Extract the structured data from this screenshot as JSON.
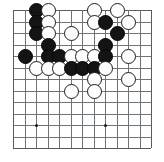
{
  "figure": {
    "name": "go-board-position",
    "board": {
      "columns": 13,
      "rows": 13,
      "origin_x": 13,
      "origin_y": 10,
      "spacing": 11.5,
      "line_color": "#6f7376",
      "edge_color": "#585c5f",
      "background": "#ffffff"
    },
    "star_points": [
      {
        "col": 2,
        "row": 10
      },
      {
        "col": 8,
        "row": 10
      },
      {
        "col": 8,
        "row": 3
      }
    ],
    "stones": [
      {
        "color": "black",
        "col": 2,
        "row": 0
      },
      {
        "color": "white",
        "col": 3,
        "row": 0
      },
      {
        "color": "white",
        "col": 7,
        "row": 0
      },
      {
        "color": "white",
        "col": 9,
        "row": 0
      },
      {
        "color": "black",
        "col": 2,
        "row": 1
      },
      {
        "color": "white",
        "col": 3,
        "row": 1
      },
      {
        "color": "white",
        "col": 7,
        "row": 1
      },
      {
        "color": "black",
        "col": 8,
        "row": 1
      },
      {
        "color": "white",
        "col": 10,
        "row": 1
      },
      {
        "color": "black",
        "col": 2,
        "row": 2
      },
      {
        "color": "white",
        "col": 3,
        "row": 2
      },
      {
        "color": "white",
        "col": 5,
        "row": 2
      },
      {
        "color": "black",
        "col": 9,
        "row": 2
      },
      {
        "color": "black",
        "col": 3,
        "row": 3
      },
      {
        "color": "black",
        "col": 8,
        "row": 3
      },
      {
        "color": "black",
        "col": 1,
        "row": 4
      },
      {
        "color": "black",
        "col": 3,
        "row": 4
      },
      {
        "color": "black",
        "col": 4,
        "row": 4
      },
      {
        "color": "white",
        "col": 5,
        "row": 4
      },
      {
        "color": "white",
        "col": 6,
        "row": 4
      },
      {
        "color": "white",
        "col": 7,
        "row": 4
      },
      {
        "color": "black",
        "col": 8,
        "row": 4
      },
      {
        "color": "white",
        "col": 10,
        "row": 4
      },
      {
        "color": "white",
        "col": 2,
        "row": 5
      },
      {
        "color": "white",
        "col": 3,
        "row": 5
      },
      {
        "color": "white",
        "col": 4,
        "row": 5
      },
      {
        "color": "black",
        "col": 5,
        "row": 5
      },
      {
        "color": "black",
        "col": 6,
        "row": 5
      },
      {
        "color": "black",
        "col": 7,
        "row": 5
      },
      {
        "color": "white",
        "col": 8,
        "row": 5
      },
      {
        "color": "white",
        "col": 7,
        "row": 6
      },
      {
        "color": "white",
        "col": 10,
        "row": 6
      },
      {
        "color": "white",
        "col": 5,
        "row": 7
      },
      {
        "color": "white",
        "col": 7,
        "row": 7
      }
    ]
  }
}
